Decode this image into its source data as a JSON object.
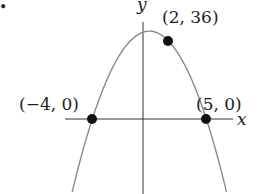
{
  "figure": {
    "bullet": "•",
    "axes": {
      "x_label": "x",
      "y_label": "y"
    },
    "curve": {
      "type": "parabola",
      "color": "#8a8a8a",
      "roots": [
        -4,
        5
      ],
      "passes_through": [
        2,
        36
      ]
    },
    "points": [
      {
        "label": "(−4, 0)",
        "x": -4,
        "y": 0
      },
      {
        "label": "(5, 0)",
        "x": 5,
        "y": 0
      },
      {
        "label": "(2, 36)",
        "x": 2,
        "y": 36
      }
    ],
    "colors": {
      "axis": "#333333",
      "point": "#111111",
      "curve": "#8a8a8a"
    }
  },
  "chart_data": {
    "type": "line",
    "title": "",
    "xlabel": "x",
    "ylabel": "y",
    "series": [
      {
        "name": "y = -2(x+4)(x-5)",
        "marked_points": [
          {
            "x": -4,
            "y": 0,
            "label": "(−4, 0)"
          },
          {
            "x": 5,
            "y": 0,
            "label": "(5, 0)"
          },
          {
            "x": 2,
            "y": 36,
            "label": "(2, 36)"
          }
        ]
      }
    ],
    "grid": false,
    "legend": "none"
  }
}
